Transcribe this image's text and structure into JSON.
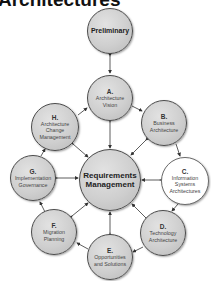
{
  "title": "Architectures",
  "colors": {
    "node_fill": "#cfcfcf",
    "node_border": "#4a4a4a",
    "highlight_fill": "#ffffff",
    "arrow": "#333333"
  },
  "nodes": {
    "preliminary": {
      "letter": "",
      "name": "Preliminary"
    },
    "a": {
      "letter": "A.",
      "name": "Architecture Vision"
    },
    "b": {
      "letter": "B.",
      "name": "Business Architecture"
    },
    "c": {
      "letter": "C.",
      "name": "Information Systems Architectures"
    },
    "d": {
      "letter": "D.",
      "name": "Technology Architecture"
    },
    "e": {
      "letter": "E.",
      "name": "Opportunities and Solutions"
    },
    "f": {
      "letter": "F.",
      "name": "Migration Planning"
    },
    "g": {
      "letter": "G.",
      "name": "Implementation Governance"
    },
    "h": {
      "letter": "H.",
      "name": "Architecture Change Management"
    },
    "center": {
      "letter": "",
      "name": "Requirements Management"
    }
  }
}
